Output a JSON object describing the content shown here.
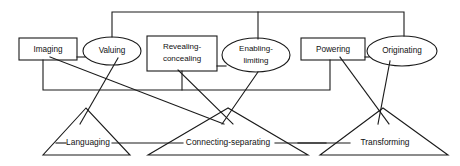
{
  "diagram": {
    "background_color": "#ffffff",
    "stroke_color": "#1a1a1a",
    "boxes": [
      {
        "id": "imaging",
        "label": "Imaging",
        "shape": "rectangle",
        "x": 19,
        "y": 38,
        "w": 58,
        "h": 22
      },
      {
        "id": "revealing-concealing",
        "label_line1": "Revealing-",
        "label_line2": "concealing",
        "shape": "rectangle",
        "x": 147,
        "y": 36,
        "w": 70,
        "h": 35
      },
      {
        "id": "powering",
        "label": "Powering",
        "shape": "rectangle",
        "x": 301,
        "y": 38,
        "w": 64,
        "h": 22
      }
    ],
    "ellipses": [
      {
        "id": "valuing",
        "label": "Valuing",
        "shape": "ellipse",
        "cx": 112,
        "cy": 51,
        "rx": 29,
        "ry": 14
      },
      {
        "id": "enabling-limiting",
        "label_line1": "Enabling-",
        "label_line2": "limiting",
        "shape": "ellipse",
        "cx": 256,
        "cy": 55,
        "rx": 34,
        "ry": 17
      },
      {
        "id": "originating",
        "label": "Originating",
        "shape": "ellipse",
        "cx": 402,
        "cy": 51,
        "rx": 35,
        "ry": 15
      }
    ],
    "triangles": [
      {
        "id": "languaging",
        "label": "Languaging",
        "apex_x": 86,
        "apex_y": 108,
        "left_x": 43,
        "right_x": 130,
        "base_y": 155,
        "label_y": 143
      },
      {
        "id": "connecting-separating",
        "label": "Connecting-separating",
        "apex_x": 228,
        "apex_y": 108,
        "left_x": 148,
        "right_x": 308,
        "base_y": 155,
        "label_y": 143
      },
      {
        "id": "transforming",
        "label": "Transforming",
        "apex_x": 383,
        "apex_y": 108,
        "left_x": 320,
        "right_x": 448,
        "base_y": 155,
        "label_y": 143
      }
    ],
    "connectors": [
      {
        "id": "top-bus",
        "description": "top horizontal bus joining Valuing, Enabling-limiting and Originating",
        "path": "M112,37 L112,12 L404,12 L404,36"
      },
      {
        "id": "top-bus-drop-enabling",
        "description": "drop from top bus into Enabling-limiting",
        "path": "M258,12 L258,38"
      },
      {
        "id": "mid-bus",
        "description": "middle horizontal bus joining Imaging, Revealing-concealing and Powering",
        "path": "M43,60 L43,90 L330,90 L330,60"
      },
      {
        "id": "mid-bus-drop-revealing",
        "description": "drop from Revealing-concealing into middle bus",
        "path": "M182,71 L182,90"
      },
      {
        "id": "imaging-valuing-link",
        "description": "horizontal link between Imaging and Valuing",
        "path": "M77,57 L84,57"
      },
      {
        "id": "revealing-enabling-link",
        "description": "horizontal link between Revealing-concealing and Enabling-limiting",
        "path": "M217,66 L224,66"
      },
      {
        "id": "powering-originating-link",
        "description": "horizontal link between Powering and Originating",
        "path": "M365,57 L368,57"
      },
      {
        "id": "imaging-to-connecting",
        "description": "Imaging down to Connecting-separating apex region",
        "path": "M50,57 L224,123"
      },
      {
        "id": "valuing-to-languaging",
        "description": "Valuing down to Languaging apex region",
        "path": "M117,58 L80,123"
      },
      {
        "id": "revealing-to-connecting",
        "description": "Revealing-concealing down to Connecting-separating",
        "path": "M178,70 L232,123"
      },
      {
        "id": "enabling-to-connecting",
        "description": "Enabling-limiting down to Connecting-separating",
        "path": "M258,71 L222,123"
      },
      {
        "id": "powering-to-transforming",
        "description": "Powering down to Transforming",
        "path": "M340,57 L388,123"
      },
      {
        "id": "originating-to-transforming",
        "description": "Originating down to Transforming",
        "path": "M388,60 L378,123"
      },
      {
        "id": "languaging-connecting-base",
        "description": "baseline link between Languaging and Connecting-separating labels",
        "path": "M112,143 L182,143"
      },
      {
        "id": "connecting-transforming-base",
        "description": "baseline link between Connecting-separating and Transforming labels",
        "path": "M272,143 L348,143"
      },
      {
        "id": "languaging-left-stub",
        "description": "left stub into Languaging label line",
        "path": "M60,143 L66,143"
      },
      {
        "id": "transforming-right-stub",
        "description": "right stub from Transforming label line",
        "path": "M300,143 L324,143"
      }
    ]
  }
}
